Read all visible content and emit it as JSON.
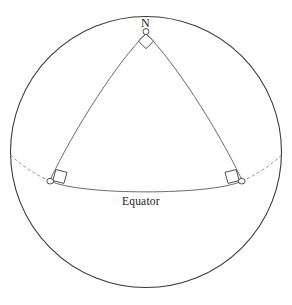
{
  "figure": {
    "background_color": "#ffffff",
    "width": 292,
    "height": 305,
    "labels": {
      "north_pole": "N",
      "equator": "Equator"
    },
    "colors": {
      "sphere_outline": "#3a3a3a",
      "great_circle_arc": "#6b6b6b",
      "equator_arc": "#6b6b6b",
      "hidden_arc_dashed": "#9a9a9a",
      "marker_stroke": "#3a3a3a",
      "marker_fill": "#ffffff",
      "text": "#1a1a1a"
    },
    "sphere": {
      "center_x": 146,
      "center_y": 152,
      "radius": 135.5
    },
    "vertices": [
      {
        "name": "north-pole-vertex",
        "x": 146,
        "y": 32,
        "angle_marker": "diamond-right-angle"
      },
      {
        "name": "equator-vertex-left",
        "x": 50,
        "y": 181,
        "angle_marker": "square-right-angle"
      },
      {
        "name": "equator-vertex-right",
        "x": 242,
        "y": 181,
        "angle_marker": "square-right-angle"
      }
    ],
    "arcs": [
      {
        "name": "meridian-arc-left",
        "style": "solid",
        "from": "north-pole-vertex",
        "to": "equator-vertex-left"
      },
      {
        "name": "meridian-arc-right",
        "style": "solid",
        "from": "north-pole-vertex",
        "to": "equator-vertex-right"
      },
      {
        "name": "equator-front-arc",
        "style": "solid",
        "from": "equator-vertex-left",
        "to": "equator-vertex-right"
      },
      {
        "name": "equator-hidden-arc-left",
        "style": "dashed",
        "from": "equator-vertex-left",
        "to": "sphere-left-edge"
      },
      {
        "name": "equator-hidden-arc-right",
        "style": "dashed",
        "from": "equator-vertex-right",
        "to": "sphere-right-edge"
      }
    ]
  }
}
